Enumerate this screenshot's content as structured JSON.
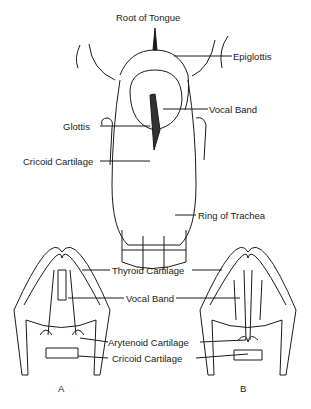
{
  "top_figure": {
    "labels": {
      "root_of_tongue": "Root of Tongue",
      "epiglottis": "Epiglottis",
      "vocal_band": "Vocal Band",
      "glottis": "Glottis",
      "cricoid_cartilage": "Cricoid Cartilage",
      "ring_of_trachea": "Ring of Trachea"
    }
  },
  "bottom_figures": {
    "labels": {
      "thyroid_cartilage": "Thyroid Cartilage",
      "vocal_band": "Vocal Band",
      "arytenoid_cartilage": "Arytenoid Cartilage",
      "cricoid_cartilage": "Cricoid Cartilage"
    },
    "panel_a": "A",
    "panel_b": "B"
  },
  "colors": {
    "ink": "#1a1a1a",
    "background": "#ffffff"
  }
}
